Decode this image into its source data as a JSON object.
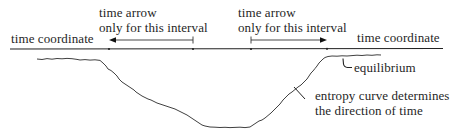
{
  "diagram": {
    "labels": {
      "time_coordinate_left": "time coordinate",
      "time_coordinate_right": "time coordinate",
      "interval1_line1": "time arrow",
      "interval1_line2": "only for this interval",
      "interval2_line1": "time arrow",
      "interval2_line2": "only for this interval",
      "equilibrium": "equilibrium",
      "entropy_line1": "entropy curve determines",
      "entropy_line2": "the direction of time"
    },
    "time_axis": {
      "y": 49,
      "x_start": 10,
      "x_end": 443,
      "tick_marks_x": [
        109,
        193,
        251,
        327
      ]
    },
    "arrows": [
      {
        "name": "interval-1-arrow",
        "from_x": 193,
        "to_x": 111,
        "y": 40,
        "direction": "left"
      },
      {
        "name": "interval-2-arrow",
        "from_x": 251,
        "to_x": 327,
        "y": 40,
        "direction": "right"
      }
    ],
    "entropy_curve": {
      "description": "high plateau (equilibrium) at left, descends to low minimum in middle, rises back to high plateau (equilibrium) at right",
      "shape": "U-shaped"
    },
    "colors": {
      "ink": "#1f1f1f",
      "background": "#ffffff"
    }
  }
}
